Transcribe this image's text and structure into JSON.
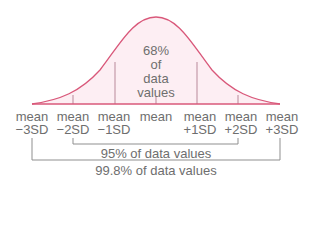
{
  "diagram": {
    "center_label": {
      "line1": "68%",
      "line2": "of",
      "line3": "data",
      "line4": "values"
    },
    "axis_labels": [
      {
        "top": "mean",
        "bottom": "−3SD"
      },
      {
        "top": "mean",
        "bottom": "−2SD"
      },
      {
        "top": "mean",
        "bottom": "−1SD"
      },
      {
        "top": "mean",
        "bottom": ""
      },
      {
        "top": "mean",
        "bottom": "+1SD"
      },
      {
        "top": "mean",
        "bottom": "+2SD"
      },
      {
        "top": "mean",
        "bottom": "+3SD"
      }
    ],
    "brackets": [
      {
        "label": "95% of data values",
        "from": "mean −2SD",
        "to": "mean +2SD"
      },
      {
        "label": "99.8% of data values",
        "from": "mean −3SD",
        "to": "mean +3SD"
      }
    ],
    "colors": {
      "curve": "#d9587a",
      "fill": "#fdeef3",
      "divider": "#b07a8a",
      "bracket": "#8a8a8a",
      "text": "#6e6e6e"
    }
  }
}
